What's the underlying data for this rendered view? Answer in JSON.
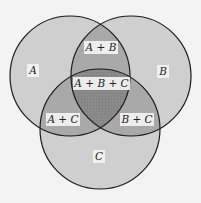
{
  "diagram": {
    "type": "venn",
    "sets": [
      {
        "id": "A",
        "label": "A",
        "cx": 70,
        "cy": 76,
        "r": 60
      },
      {
        "id": "B",
        "label": "B",
        "cx": 131,
        "cy": 76,
        "r": 60
      },
      {
        "id": "C",
        "label": "C",
        "cx": 100,
        "cy": 129,
        "r": 60
      }
    ],
    "region_labels": {
      "a": "A",
      "b": "B",
      "c": "C",
      "ab": "A + B",
      "ac": "A + C",
      "bc": "B + C",
      "abc": "A + B + C"
    },
    "colors": {
      "background": "#f3f3f3",
      "single": "#cfcfcf",
      "double": "#a9a9a9",
      "triple": "#8a8a8a",
      "stroke": "#1a1a1a",
      "label_box": "#f4f4f4"
    }
  }
}
